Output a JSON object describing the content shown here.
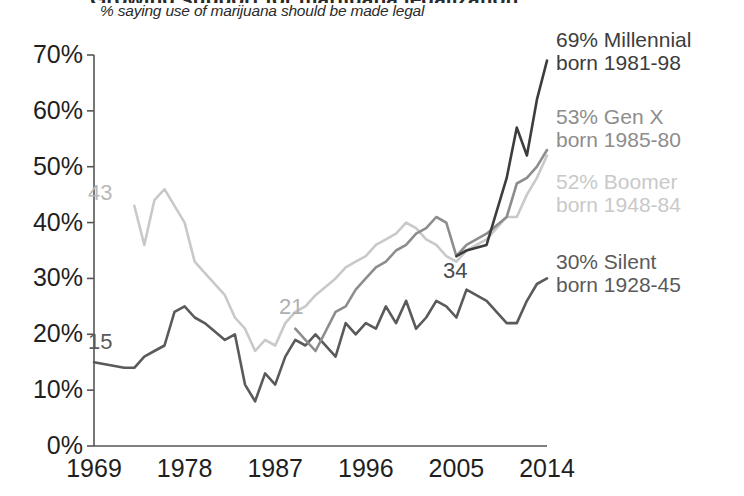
{
  "header": {
    "title_clipped": "Growing support for marijuana legalization",
    "subtitle": "% saying use of marijuana should be made legal"
  },
  "colors": {
    "millennial": "#3d3d3d",
    "genx": "#8d8d8d",
    "boomer": "#c9c9c9",
    "silent": "#5a5a5a",
    "axis": "#555555",
    "text": "#1f1f1f"
  },
  "legend": {
    "position": "right",
    "items": [
      {
        "name": "millennial",
        "line1": "69% Millennial",
        "line2": "born 1981-98",
        "color": "#3d3d3d"
      },
      {
        "name": "genx",
        "line1": "53% Gen X",
        "line2": "born 1985-80",
        "color": "#8d8d8d"
      },
      {
        "name": "boomer",
        "line1": "52% Boomer",
        "line2": "born 1948-84",
        "color": "#c9c9c9"
      },
      {
        "name": "silent",
        "line1": "30% Silent",
        "line2": "born 1928-45",
        "color": "#5a5a5a"
      }
    ]
  },
  "annotations": [
    {
      "name": "silent-start",
      "text": "15",
      "color": "#5a5a5a",
      "x": 88,
      "y": 331
    },
    {
      "name": "boomer-start",
      "text": "43",
      "color": "#b9b9b9",
      "x": 88,
      "y": 182
    },
    {
      "name": "genx-start",
      "text": "21",
      "color": "#b0b0b0",
      "x": 279,
      "y": 296
    },
    {
      "name": "millennial-start",
      "text": "34",
      "color": "#4a4a4a",
      "x": 443,
      "y": 260
    }
  ],
  "chart_data": {
    "type": "line",
    "title": "Growing support for marijuana legalization",
    "subtitle": "% saying use of marijuana should be made legal",
    "xlabel": "",
    "ylabel": "",
    "ylim": [
      0,
      70
    ],
    "xlim": [
      1969,
      2014
    ],
    "grid": false,
    "ytick_labels": [
      "0%",
      "10%",
      "20%",
      "30%",
      "40%",
      "50%",
      "60%",
      "70%"
    ],
    "ytick_values": [
      0,
      10,
      20,
      30,
      40,
      50,
      60,
      70
    ],
    "xtick_labels": [
      "1969",
      "1978",
      "1987",
      "1996",
      "2005",
      "2014"
    ],
    "xtick_values": [
      1969,
      1978,
      1987,
      1996,
      2005,
      2014
    ],
    "series": [
      {
        "name": "Silent",
        "label": "30% Silent",
        "born": "born 1928-45",
        "color": "#5a5a5a",
        "end_value": 30,
        "start_value": 15,
        "x": [
          1969,
          1972,
          1973,
          1974,
          1975,
          1976,
          1977,
          1978,
          1979,
          1980,
          1982,
          1983,
          1984,
          1985,
          1986,
          1987,
          1988,
          1989,
          1990,
          1991,
          1993,
          1994,
          1995,
          1996,
          1997,
          1998,
          1999,
          2000,
          2001,
          2002,
          2003,
          2004,
          2005,
          2006,
          2008,
          2010,
          2011,
          2012,
          2013,
          2014
        ],
        "values": [
          15,
          14,
          14,
          16,
          17,
          18,
          24,
          25,
          23,
          22,
          19,
          20,
          11,
          8,
          13,
          11,
          16,
          19,
          18,
          20,
          16,
          22,
          20,
          22,
          21,
          25,
          22,
          26,
          21,
          23,
          26,
          25,
          23,
          28,
          26,
          22,
          22,
          26,
          29,
          30
        ]
      },
      {
        "name": "Boomer",
        "label": "52% Boomer",
        "born": "born 1948-84",
        "color": "#c9c9c9",
        "end_value": 52,
        "start_value": 43,
        "x": [
          1973,
          1974,
          1975,
          1976,
          1977,
          1978,
          1979,
          1980,
          1982,
          1983,
          1984,
          1985,
          1986,
          1987,
          1988,
          1989,
          1990,
          1991,
          1993,
          1994,
          1995,
          1996,
          1997,
          1998,
          1999,
          2000,
          2001,
          2002,
          2003,
          2004,
          2005,
          2006,
          2008,
          2010,
          2011,
          2012,
          2013,
          2014
        ],
        "values": [
          43,
          36,
          44,
          46,
          43,
          40,
          33,
          31,
          27,
          23,
          21,
          17,
          19,
          18,
          22,
          24,
          25,
          27,
          30,
          32,
          33,
          34,
          36,
          37,
          38,
          40,
          39,
          37,
          36,
          34,
          33,
          35,
          37,
          41,
          41,
          45,
          48,
          52
        ]
      },
      {
        "name": "Gen X",
        "label": "53% Gen X",
        "born": "born 1985-80",
        "color": "#8d8d8d",
        "end_value": 53,
        "start_value": 21,
        "x": [
          1989,
          1990,
          1991,
          1993,
          1994,
          1995,
          1996,
          1997,
          1998,
          1999,
          2000,
          2001,
          2002,
          2003,
          2004,
          2005,
          2006,
          2008,
          2010,
          2011,
          2012,
          2013,
          2014
        ],
        "values": [
          21,
          19,
          17,
          24,
          25,
          28,
          30,
          32,
          33,
          35,
          36,
          38,
          39,
          41,
          40,
          34,
          36,
          38,
          41,
          47,
          48,
          50,
          53
        ]
      },
      {
        "name": "Millennial",
        "label": "69% Millennial",
        "born": "born 1981-98",
        "color": "#3d3d3d",
        "end_value": 69,
        "start_value": 34,
        "x": [
          2005,
          2006,
          2008,
          2010,
          2011,
          2012,
          2013,
          2014
        ],
        "values": [
          34,
          35,
          36,
          48,
          57,
          52,
          62,
          69
        ]
      }
    ]
  },
  "axes": {
    "y_px_top": 55,
    "y_px_bottom": 446,
    "x_px_left": 94,
    "x_px_right": 547
  }
}
